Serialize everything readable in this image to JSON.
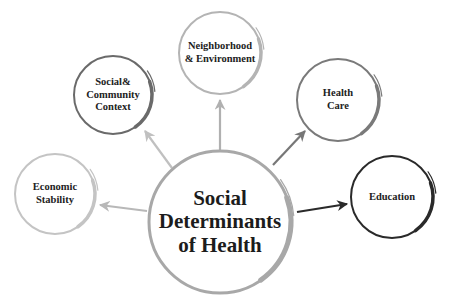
{
  "diagram": {
    "type": "hub-and-spoke",
    "center": {
      "id": "sdoh",
      "label": "Social\nDeterminants\nof Health",
      "cx": 220,
      "cy": 222,
      "r": 71,
      "color": "#a8a8a8"
    },
    "nodes": [
      {
        "id": "economic",
        "label": "Economic\nStability",
        "cx": 55,
        "cy": 194,
        "r": 40,
        "color": "#c4c4c4"
      },
      {
        "id": "social",
        "label": "Social&\nCommunity\nContext",
        "cx": 113,
        "cy": 95,
        "r": 39,
        "color": "#6a6a6a"
      },
      {
        "id": "neighborhood",
        "label": "Neighborhood\n& Environment",
        "cx": 220,
        "cy": 53,
        "r": 41,
        "color": "#b4b4b4"
      },
      {
        "id": "healthcare",
        "label": "Health\nCare",
        "cx": 338,
        "cy": 100,
        "r": 41,
        "color": "#7a7a7a"
      },
      {
        "id": "education",
        "label": "Education",
        "cx": 392,
        "cy": 197,
        "r": 41,
        "color": "#2a2a2a"
      }
    ],
    "arrows": [
      {
        "to": "economic",
        "x1": 147,
        "y1": 211,
        "x2": 100,
        "y2": 205,
        "color": "#b8b8b8"
      },
      {
        "to": "social",
        "x1": 172,
        "y1": 168,
        "x2": 145,
        "y2": 131,
        "color": "#c0c0c0"
      },
      {
        "to": "neighborhood",
        "x1": 220,
        "y1": 150,
        "x2": 220,
        "y2": 100,
        "color": "#b0b0b0"
      },
      {
        "to": "healthcare",
        "x1": 273,
        "y1": 165,
        "x2": 305,
        "y2": 131,
        "color": "#777777"
      },
      {
        "to": "education",
        "x1": 297,
        "y1": 212,
        "x2": 347,
        "y2": 204,
        "color": "#2a2a2a"
      }
    ]
  }
}
